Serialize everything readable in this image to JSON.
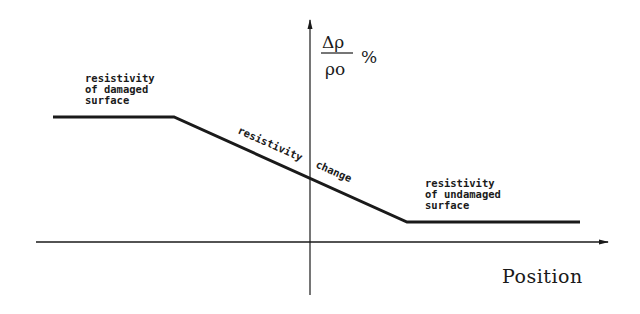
{
  "diagram": {
    "y_axis_label": {
      "numerator": "Δρ",
      "denominator": "ρo",
      "unit": "%"
    },
    "x_axis_label": "Position",
    "labels": {
      "damaged": [
        "resistivity",
        "of damaged",
        "surface"
      ],
      "change": [
        "resistivity",
        "change"
      ],
      "undamaged": [
        "resistivity",
        "of undamaged",
        "surface"
      ]
    },
    "profile_points": [
      [
        53,
        117
      ],
      [
        174,
        117
      ],
      [
        407,
        222
      ],
      [
        580,
        222
      ]
    ],
    "colors": {
      "line": "#1a1a1a",
      "background": "#ffffff"
    }
  }
}
